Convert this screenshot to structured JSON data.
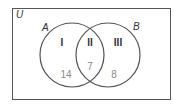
{
  "diagram": {
    "type": "venn",
    "universe_label": "U",
    "sets": [
      {
        "label": "A"
      },
      {
        "label": "B"
      }
    ],
    "regions": [
      {
        "roman": "I",
        "description": "A only",
        "count": "14"
      },
      {
        "roman": "II",
        "description": "A and B",
        "count": "7"
      },
      {
        "roman": "III",
        "description": "B only",
        "count": "8"
      }
    ],
    "colors": {
      "stroke": "#555555",
      "label": "#333333",
      "count": "#888888"
    }
  }
}
